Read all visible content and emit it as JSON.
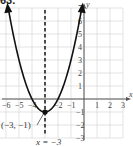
{
  "problem_label": "63.",
  "chart_data": {
    "type": "line",
    "title": "",
    "function": "y = (x + 3)^2 - 1",
    "xlabel": "x",
    "ylabel": "y",
    "xlim": [
      -7,
      3
    ],
    "ylim": [
      -3,
      7
    ],
    "grid": true,
    "x_ticks": [
      -7,
      -6,
      -5,
      -4,
      -2,
      -1,
      1,
      2,
      3
    ],
    "y_ticks": [
      -3,
      -2,
      -1,
      1,
      2,
      3,
      4,
      5,
      6,
      7
    ],
    "x_tick_labels": [
      "-7",
      "-6",
      "-5",
      "-4",
      "-2",
      "-1",
      "1",
      "2",
      "3"
    ],
    "y_tick_labels": [
      "-3",
      "-2",
      "-1",
      "1",
      "2",
      "3",
      "4",
      "5",
      "6",
      "7"
    ],
    "series": [
      {
        "name": "parabola",
        "x": [
          -5.83,
          -5,
          -4,
          -3,
          -2,
          -1,
          -0.17
        ],
        "y": [
          7,
          3,
          0,
          -1,
          0,
          3,
          7
        ]
      }
    ],
    "vertex": {
      "x": -3,
      "y": -1,
      "label": "(−3, −1)"
    },
    "axis_of_symmetry": {
      "x": -3,
      "label": "x = −3",
      "style": "dashed"
    }
  }
}
